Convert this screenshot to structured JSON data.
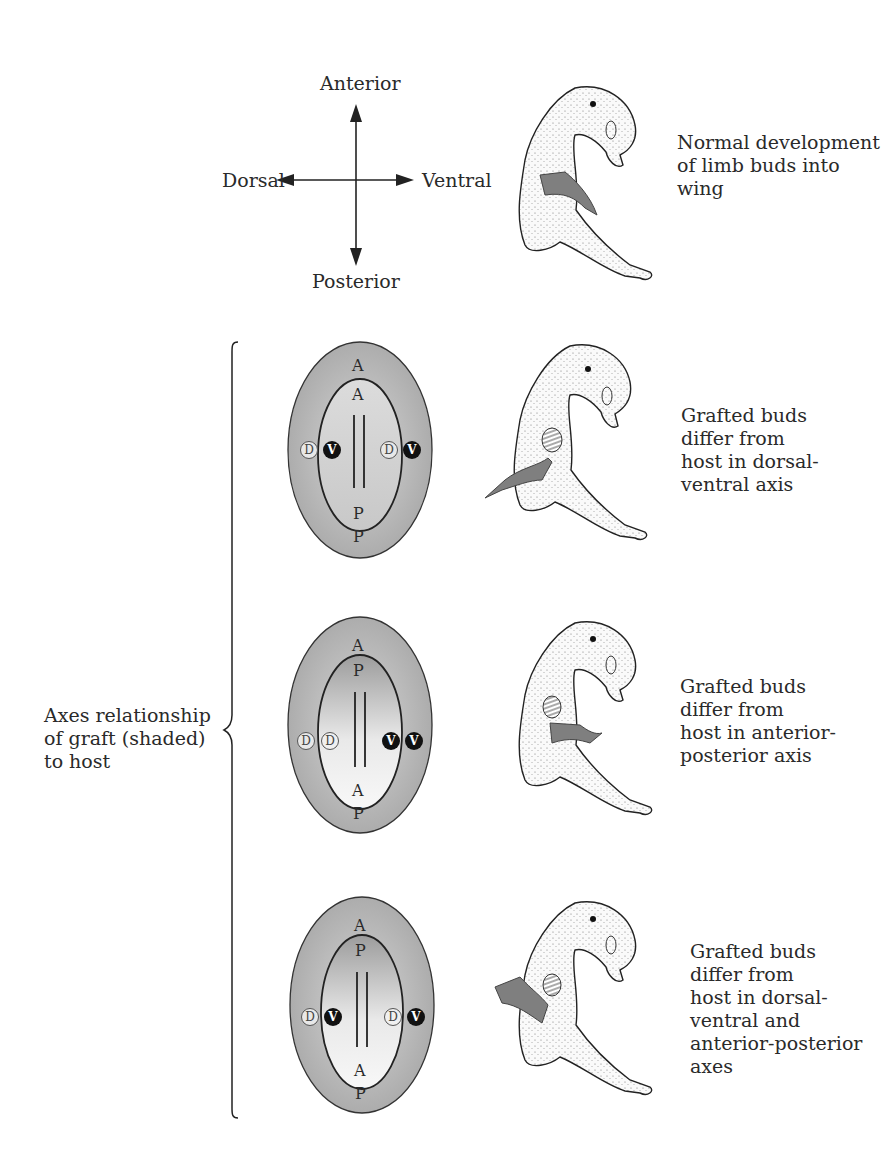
{
  "compass": {
    "anterior": "Anterior",
    "posterior": "Posterior",
    "dorsal": "Dorsal",
    "ventral": "Ventral"
  },
  "bracket_label": {
    "lines": [
      "Axes relationship",
      "of graft (shaded)",
      "to host"
    ]
  },
  "rows": [
    {
      "caption": [
        "Normal development",
        "of limb buds into",
        "wing"
      ]
    },
    {
      "caption": [
        "Grafted buds",
        "differ from",
        "host in dorsal-",
        "ventral axis"
      ],
      "outer_top": "A",
      "outer_bottom": "P",
      "inner_top": "A",
      "inner_bottom": "P",
      "left_outer": "D",
      "left_inner": "V",
      "right_inner": "D",
      "right_outer": "V"
    },
    {
      "caption": [
        "Grafted buds",
        "differ from",
        "host in anterior-",
        "posterior axis"
      ],
      "outer_top": "A",
      "outer_bottom": "P",
      "inner_top": "P",
      "inner_bottom": "A",
      "left_outer": "D",
      "left_inner": "D",
      "right_inner": "V",
      "right_outer": "V"
    },
    {
      "caption": [
        "Grafted buds",
        "differ from",
        "host in dorsal-",
        "ventral and",
        "anterior-posterior",
        "axes"
      ],
      "outer_top": "A",
      "outer_bottom": "P",
      "inner_top": "P",
      "inner_bottom": "A",
      "left_outer": "D",
      "left_inner": "V",
      "right_inner": "D",
      "right_outer": "V"
    }
  ],
  "colors": {
    "outer_shade": "#a9a9a9",
    "inner_shade_dark": "#9a9a9a",
    "inner_light": "#f2f2f2",
    "wing_graft": "#7f7f7f",
    "ink": "#222222"
  }
}
